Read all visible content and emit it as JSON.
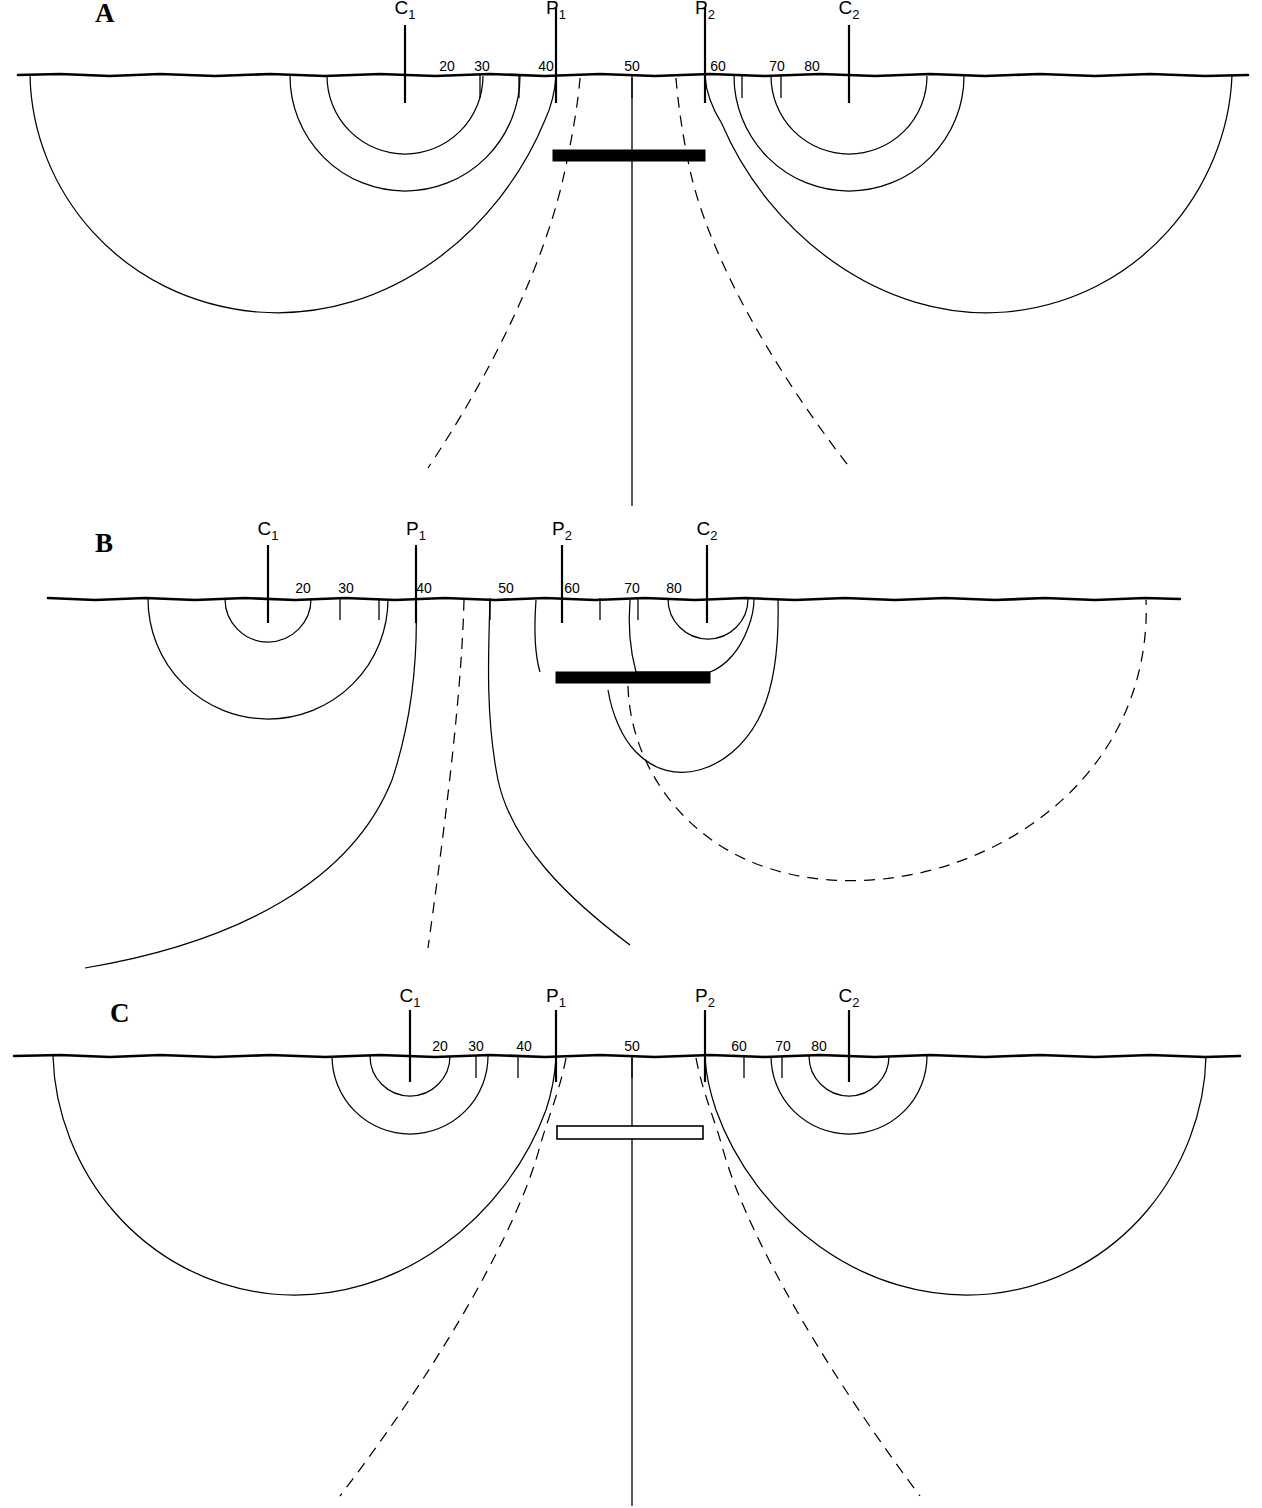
{
  "figure": {
    "width": 1262,
    "height": 1508,
    "background_color": "#ffffff",
    "line_color": "#000000"
  },
  "panels": [
    {
      "id": "A",
      "letter": "A",
      "letter_x": 95,
      "letter_y": 22,
      "ground_y": 75,
      "description": "Homogeneous / conductive sheet centred between P1 and P2",
      "buried_body": {
        "name": "conductive-body",
        "type": "conductive",
        "fill": "#000000",
        "x": 553,
        "y": 150,
        "width": 152,
        "height": 11
      },
      "electrodes": [
        {
          "name": "C1",
          "symbol": "C",
          "subscript": "1",
          "x": 405,
          "label_y": 14,
          "stem_top": 25,
          "stem_bottom": 103
        },
        {
          "name": "P1",
          "symbol": "P",
          "subscript": "1",
          "x": 556,
          "label_y": 14,
          "stem_top": 8,
          "stem_bottom": 103
        },
        {
          "name": "P2",
          "symbol": "P",
          "subscript": "2",
          "x": 705,
          "label_y": 14,
          "stem_top": 8,
          "stem_bottom": 103
        },
        {
          "name": "C2",
          "symbol": "C",
          "subscript": "2",
          "x": 849,
          "label_y": 14,
          "stem_top": 25,
          "stem_bottom": 103
        }
      ],
      "scale_ticks": [
        {
          "label": "20",
          "label_x": 447,
          "tick_x": 480
        },
        {
          "label": "30",
          "label_x": 482,
          "tick_x": 519
        },
        {
          "label": "40",
          "label_x": 546,
          "tick_x": 556
        },
        {
          "label": "50",
          "label_x": 632,
          "tick_x": 632
        },
        {
          "label": "60",
          "label_x": 718,
          "tick_x": 705
        },
        {
          "label": "70",
          "label_x": 777,
          "tick_x": 742
        },
        {
          "label": "80",
          "label_x": 812,
          "tick_x": 781
        }
      ]
    },
    {
      "id": "B",
      "letter": "B",
      "letter_x": 95,
      "letter_y": 552,
      "ground_y": 598,
      "description": "Conductive sheet offset to the right beneath C2",
      "buried_body": {
        "name": "conductive-body",
        "type": "conductive",
        "fill": "#000000",
        "x": 556,
        "y": 672,
        "width": 154,
        "height": 11
      },
      "electrodes": [
        {
          "name": "C1",
          "symbol": "C",
          "subscript": "1",
          "x": 268,
          "label_y": 533,
          "stem_top": 545,
          "stem_bottom": 623
        },
        {
          "name": "P1",
          "symbol": "P",
          "subscript": "1",
          "x": 416,
          "label_y": 533,
          "stem_top": 545,
          "stem_bottom": 623
        },
        {
          "name": "P2",
          "symbol": "P",
          "subscript": "2",
          "x": 562,
          "label_y": 533,
          "stem_top": 545,
          "stem_bottom": 623
        },
        {
          "name": "C2",
          "symbol": "C",
          "subscript": "2",
          "x": 707,
          "label_y": 533,
          "stem_top": 545,
          "stem_bottom": 623
        }
      ],
      "scale_ticks": [
        {
          "label": "20",
          "label_x": 303,
          "tick_x": 340
        },
        {
          "label": "30",
          "label_x": 346,
          "tick_x": 379
        },
        {
          "label": "40",
          "label_x": 424,
          "tick_x": 416
        },
        {
          "label": "50",
          "label_x": 506,
          "tick_x": 490
        },
        {
          "label": "60",
          "label_x": 572,
          "tick_x": 562
        },
        {
          "label": "70",
          "label_x": 632,
          "tick_x": 600
        },
        {
          "label": "80",
          "label_x": 674,
          "tick_x": 638
        }
      ]
    },
    {
      "id": "C",
      "letter": "C",
      "letter_x": 110,
      "letter_y": 1022,
      "ground_y": 1055,
      "description": "Resistive (hollow) sheet centred between P1 and P2",
      "buried_body": {
        "name": "resistive-body",
        "type": "resistive",
        "fill": "#ffffff",
        "x": 557,
        "y": 1126,
        "width": 146,
        "height": 13
      },
      "electrodes": [
        {
          "name": "C1",
          "symbol": "C",
          "subscript": "1",
          "x": 410,
          "label_y": 1000,
          "stem_top": 1010,
          "stem_bottom": 1082
        },
        {
          "name": "P1",
          "symbol": "P",
          "subscript": "1",
          "x": 556,
          "label_y": 1000,
          "stem_top": 1010,
          "stem_bottom": 1082
        },
        {
          "name": "P2",
          "symbol": "P",
          "subscript": "2",
          "x": 705,
          "label_y": 1000,
          "stem_top": 1010,
          "stem_bottom": 1082
        },
        {
          "name": "C2",
          "symbol": "C",
          "subscript": "2",
          "x": 849,
          "label_y": 1000,
          "stem_top": 1010,
          "stem_bottom": 1082
        }
      ],
      "scale_ticks": [
        {
          "label": "20",
          "label_x": 440,
          "tick_x": 476
        },
        {
          "label": "30",
          "label_x": 476,
          "tick_x": 518
        },
        {
          "label": "40",
          "label_x": 524,
          "tick_x": 556
        },
        {
          "label": "50",
          "label_x": 632,
          "tick_x": 632
        },
        {
          "label": "60",
          "label_x": 739,
          "tick_x": 705
        },
        {
          "label": "70",
          "label_x": 783,
          "tick_x": 744
        },
        {
          "label": "80",
          "label_x": 819,
          "tick_x": 782
        }
      ]
    }
  ],
  "legend_semantics": {
    "solid_curve": "equipotential line",
    "dashed_curve": "current flow line",
    "black_bar": "conductive body",
    "white_bar": "resistive body"
  }
}
